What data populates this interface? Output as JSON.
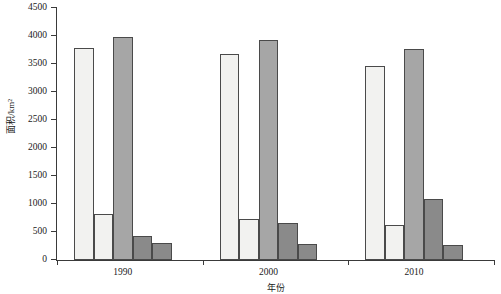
{
  "chart_data": {
    "type": "bar",
    "title": "",
    "xlabel": "年份",
    "ylabel": "面积/km²",
    "categories": [
      "1990",
      "2000",
      "2010"
    ],
    "ylim": [
      0,
      4500
    ],
    "ytick_step": 500,
    "yticks": [
      "0",
      "500",
      "1000",
      "1500",
      "2000",
      "2500",
      "3000",
      "3500",
      "4000",
      "4500"
    ],
    "grid": false,
    "legend": "none",
    "series": [
      {
        "name": "series-1",
        "color": "#f2f2f0",
        "values": [
          3780,
          3670,
          3470
        ]
      },
      {
        "name": "series-2",
        "color": "#f2f2f0",
        "values": [
          820,
          730,
          630
        ]
      },
      {
        "name": "series-3",
        "color": "#a6a6a6",
        "values": [
          3990,
          3930,
          3760
        ]
      },
      {
        "name": "series-4",
        "color": "#8a8a8a",
        "values": [
          420,
          660,
          1090
        ]
      },
      {
        "name": "series-5",
        "color": "#8a8a8a",
        "values": [
          300,
          280,
          270
        ]
      }
    ]
  }
}
